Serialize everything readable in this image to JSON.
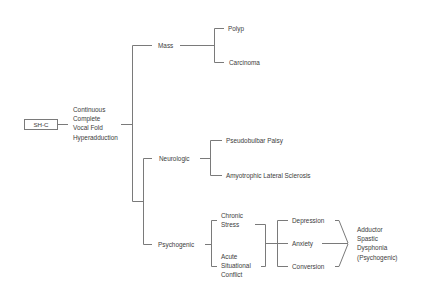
{
  "diagram": {
    "root": {
      "label": "SH-C"
    },
    "symptom": {
      "lines": [
        "Continuous",
        "Complete",
        "Vocal Fold",
        "Hyperadduction"
      ]
    },
    "categories": {
      "mass": {
        "label": "Mass",
        "children": [
          "Polyp",
          "Carcinoma"
        ]
      },
      "neurologic": {
        "label": "Neurologic",
        "children": [
          "Pseudobulbar Palsy",
          "Amyotrophic Lateral Sclerosis"
        ]
      },
      "psychogenic": {
        "label": "Psychogenic",
        "causes": {
          "chronic": {
            "lines": [
              "Chronic",
              "Stress"
            ]
          },
          "acute": {
            "lines": [
              "Acute",
              "Situational",
              "Conflict"
            ]
          }
        },
        "states": [
          "Depression",
          "Anxiety",
          "Conversion"
        ],
        "outcome": {
          "lines": [
            "Adductor",
            "Spastic",
            "Dysphonia",
            "(Psychogenic)"
          ]
        }
      }
    }
  }
}
